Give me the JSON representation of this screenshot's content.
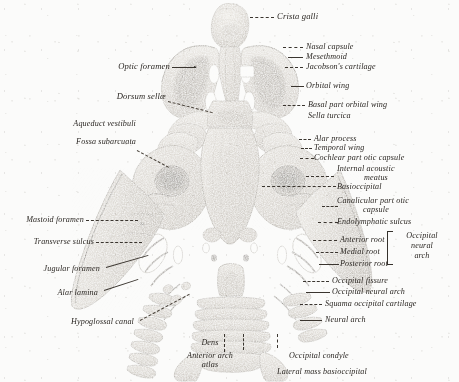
{
  "plate": {
    "subject": "fetal chondrocranium, superior (endocranial) view",
    "technique": "halftone engraving",
    "ink": "#2b2723",
    "paper": "#fbfbfa"
  },
  "labels": {
    "crista_galli": "Crista galli",
    "nasal_capsule": "Nasal capsule",
    "mesethmoid": "Mesethmoid",
    "jacobsons_cartilage": "Jacobson's cartilage",
    "orbital_wing": "Orbital wing",
    "basal_part_orbital_wing": "Basal part orbital wing",
    "sella_turcica": "Sella turcica",
    "alar_process": "Alar process",
    "temporal_wing": "Temporal wing",
    "cochlear_part_otic_capsule": "Cochlear part otic capsule",
    "internal_acoustic_meatus_1": "Internal acoustic",
    "internal_acoustic_meatus_2": "meatus",
    "basioccipital": "Basioccipital",
    "canalicular_part_otic_1": "Canalicular part otic",
    "canalicular_part_otic_2": "capsule",
    "endolymphatic_sulcus": "Endolymphatic sulcus",
    "anterior_root": "Anterior root",
    "medial_root": "Medial root",
    "posterior_root": "Posterior root",
    "occipital_neural_arch_1": "Occipital",
    "occipital_neural_arch_2": "neural",
    "occipital_neural_arch_3": "arch",
    "occipital_fissure": "Occipital fissure",
    "occipital_neural_arch": "Occipital neural arch",
    "squama_occipital_cartilage": "Squama occipital cartilage",
    "neural_arch": "Neural arch",
    "optic_foramen": "Optic foramen",
    "dorsum_sellae": "Dorsum sellæ",
    "aqueduct_vestibuli": "Aqueduct vestibuli",
    "fossa_subarcuata": "Fossa subarcuata",
    "mastoid_foramen": "Mastoid foramen",
    "transverse_sulcus": "Transverse sulcus",
    "jugular_foramen": "Jugular foramen",
    "alar_lamina": "Alar lamina",
    "hypoglossal_canal": "Hypoglossal canal",
    "dens": "Dens",
    "anterior_arch_atlas_1": "Anterior arch",
    "anterior_arch_atlas_2": "atlas",
    "occipital_condyle": "Occipital condyle",
    "lateral_mass_basioccipital": "Lateral mass basioccipital"
  }
}
